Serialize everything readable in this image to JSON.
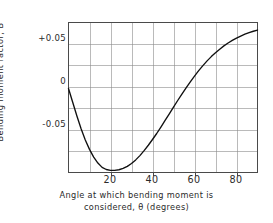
{
  "chart_data": {
    "type": "line",
    "title": "",
    "xlabel_line1": "Angle at which bending moment is",
    "xlabel_line2": "considered, θ (degrees)",
    "ylabel": "Bending moment factor, B",
    "xlim": [
      0,
      90
    ],
    "ylim": [
      -0.1,
      0.075
    ],
    "grid": true,
    "grid_x_step": 10,
    "grid_y_step": 0.025,
    "legend": "none",
    "xticks": [
      {
        "value": 20,
        "label": "20"
      },
      {
        "value": 40,
        "label": "40"
      },
      {
        "value": 60,
        "label": "60"
      },
      {
        "value": 80,
        "label": "80"
      }
    ],
    "yticks": [
      {
        "value": 0.05,
        "label": "+0.05"
      },
      {
        "value": 0.0,
        "label": "0"
      },
      {
        "value": -0.05,
        "label": "-0.05"
      }
    ],
    "series": [
      {
        "name": "Bending moment factor B",
        "color": "#101010",
        "x": [
          0,
          2,
          4,
          6,
          8,
          10,
          12,
          14,
          16,
          18,
          20,
          22,
          24,
          26,
          28,
          30,
          32,
          34,
          36,
          38,
          40,
          42,
          44,
          46,
          48,
          50,
          52,
          54,
          56,
          58,
          60,
          62,
          64,
          66,
          68,
          70,
          72,
          74,
          76,
          78,
          80,
          82,
          84,
          86,
          88,
          90
        ],
        "y": [
          -0.002,
          -0.018,
          -0.034,
          -0.049,
          -0.062,
          -0.073,
          -0.082,
          -0.089,
          -0.094,
          -0.0965,
          -0.0975,
          -0.0975,
          -0.0968,
          -0.0952,
          -0.0928,
          -0.0895,
          -0.0853,
          -0.0803,
          -0.0745,
          -0.0682,
          -0.0615,
          -0.0545,
          -0.047,
          -0.0393,
          -0.0315,
          -0.0237,
          -0.016,
          -0.0085,
          -0.0012,
          0.0058,
          0.0125,
          0.0188,
          0.0247,
          0.0302,
          0.0352,
          0.0398,
          0.0439,
          0.0477,
          0.0511,
          0.0541,
          0.0568,
          0.0592,
          0.0613,
          0.0632,
          0.0648,
          0.0662
        ]
      }
    ],
    "annotations": {
      "minimum_value": -0.0975,
      "minimum_angle_deg": 21,
      "value_at_90_deg": 0.066,
      "value_at_0_deg": 0.0
    }
  }
}
